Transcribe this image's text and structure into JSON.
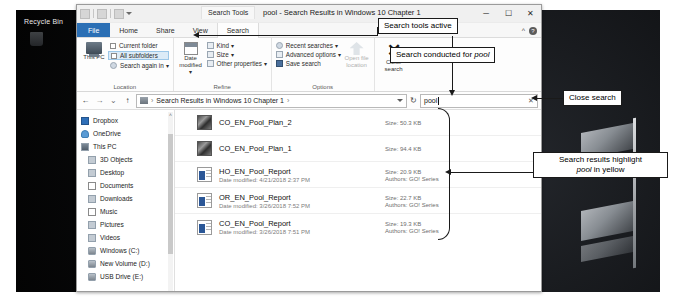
{
  "desktop": {
    "recycle_bin_label": "Recycle Bin"
  },
  "window": {
    "context_tab": "Search Tools",
    "title": "pool - Search Results in Windows 10 Chapter 1",
    "controls": {
      "minimize": "─",
      "maximize": "☐",
      "close": "✕",
      "collapse_ribbon": "^",
      "help": "?"
    },
    "tabs": [
      {
        "label": "File",
        "active": false
      },
      {
        "label": "Home",
        "active": false
      },
      {
        "label": "Share",
        "active": false
      },
      {
        "label": "View",
        "active": false
      },
      {
        "label": "Search",
        "active": true
      }
    ]
  },
  "ribbon": {
    "groups": [
      {
        "name": "Location",
        "label": "Location",
        "big_button": {
          "label": "This PC",
          "icon": "this-pc-icon"
        },
        "items": [
          {
            "label": "Current folder",
            "type": "checkbox",
            "selected": false
          },
          {
            "label": "All subfolders",
            "type": "checkbox",
            "selected": true
          },
          {
            "label": "Search again in ▾",
            "type": "menu",
            "selected": false
          }
        ]
      },
      {
        "name": "Refine",
        "label": "Refine",
        "big_button": {
          "label": "Date modified ▾",
          "icon": "calendar-icon"
        },
        "items": [
          {
            "label": "Kind ▾",
            "type": "menu"
          },
          {
            "label": "Size ▾",
            "type": "menu"
          },
          {
            "label": "Other properties ▾",
            "type": "menu"
          }
        ]
      },
      {
        "name": "Options",
        "label": "Options",
        "big_button": {
          "label": "Open file location",
          "icon": "open-location-icon",
          "disabled": true
        },
        "items": [
          {
            "label": "Recent searches ▾",
            "type": "menu"
          },
          {
            "label": "Advanced options ▾",
            "type": "menu"
          },
          {
            "label": "Save search",
            "type": "button"
          }
        ]
      }
    ],
    "close_search": {
      "label_line1": "Close",
      "label_line2": "search",
      "glyph": "✕"
    }
  },
  "address_bar": {
    "back": "←",
    "forward": "→",
    "recent": "⌄",
    "up": "↑",
    "path_icon": "folder-icon",
    "path_text": "Search Results in Windows 10 Chapter 1",
    "path_separator": "›",
    "dropdown": "chevron-down-icon",
    "refresh": "↻"
  },
  "search": {
    "value": "pool",
    "placeholder": "Search",
    "clear_glyph": "✕"
  },
  "nav_pane": {
    "items": [
      {
        "label": "Dropbox",
        "icon": "dropbox-icon",
        "indent": false
      },
      {
        "label": "OneDrive",
        "icon": "onedrive-icon",
        "indent": false
      },
      {
        "label": "This PC",
        "icon": "this-pc-icon",
        "indent": false
      },
      {
        "label": "3D Objects",
        "icon": "3d-objects-icon",
        "indent": true
      },
      {
        "label": "Desktop",
        "icon": "desktop-icon",
        "indent": true
      },
      {
        "label": "Documents",
        "icon": "documents-icon",
        "indent": true
      },
      {
        "label": "Downloads",
        "icon": "downloads-icon",
        "indent": true
      },
      {
        "label": "Music",
        "icon": "music-icon",
        "indent": true
      },
      {
        "label": "Pictures",
        "icon": "pictures-icon",
        "indent": true
      },
      {
        "label": "Videos",
        "icon": "videos-icon",
        "indent": true
      },
      {
        "label": "Windows (C:)",
        "icon": "drive-icon",
        "indent": true
      },
      {
        "label": "New Volume (D:)",
        "icon": "drive-icon",
        "indent": true
      },
      {
        "label": "USB Drive (E:)",
        "icon": "usb-drive-icon",
        "indent": true
      }
    ],
    "scroll_up_glyph": "˄"
  },
  "file_list": {
    "rows": [
      {
        "name": "CO_EN_Pool_Plan_2",
        "icon": "image-file-icon",
        "date_modified": "",
        "size": "Size: 50.3 KB",
        "authors": ""
      },
      {
        "name": "CO_EN_Pool_Plan_1",
        "icon": "image-file-icon",
        "date_modified": "",
        "size": "Size: 94.4 KB",
        "authors": ""
      },
      {
        "name": "HO_EN_Pool_Report",
        "icon": "word-file-icon",
        "date_modified": "Date modified: 4/21/2018 2:37 PM",
        "size": "Size: 20.9 KB",
        "authors": "Authors: GO! Series"
      },
      {
        "name": "OR_EN_Pool_Report",
        "icon": "word-file-icon",
        "date_modified": "Date modified: 3/26/2018 7:52 PM",
        "size": "Size: 22.7 KB",
        "authors": "Authors: GO! Series"
      },
      {
        "name": "CO_EN_Pool_Report",
        "icon": "word-file-icon",
        "date_modified": "Date modified: 3/26/2018 7:51 PM",
        "size": "Size: 19.3 KB",
        "authors": "Authors: GO! Series"
      }
    ]
  },
  "callouts": {
    "search_tools_active": "Search tools active",
    "search_conducted_pre": "Search conducted for ",
    "search_conducted_em": "pool",
    "close_search": "Close search",
    "results_highlight_line1": "Search results highlight",
    "results_highlight_em": "pool",
    "results_highlight_line2": " in yellow"
  }
}
